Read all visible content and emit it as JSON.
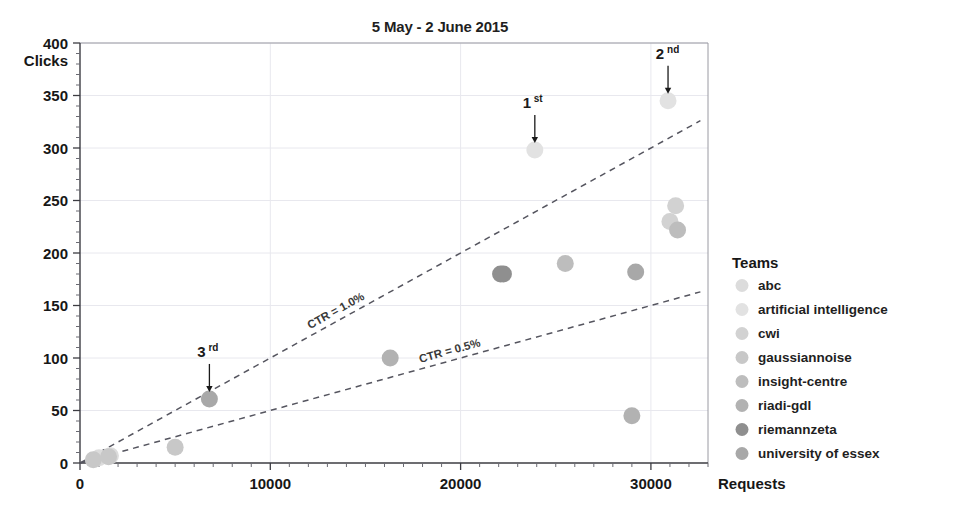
{
  "chart_data": {
    "type": "scatter",
    "title": "5 May - 2 June 2015",
    "xlabel": "Requests",
    "ylabel": "Clicks",
    "xlim": [
      0,
      33000
    ],
    "ylim": [
      0,
      400
    ],
    "xticks": [
      0,
      10000,
      20000,
      30000
    ],
    "xtick_labels": [
      "0",
      "10000",
      "20000",
      "30000"
    ],
    "yticks": [
      0,
      50,
      100,
      150,
      200,
      250,
      300,
      350,
      400
    ],
    "ytick_labels": [
      "0",
      "50",
      "100",
      "150",
      "200",
      "250",
      "300",
      "350",
      "400"
    ],
    "grid": true,
    "grid_color": "#e8e8ee",
    "minor_ticks": true,
    "legend_position": "right",
    "legend_title": "Teams",
    "series": [
      {
        "name": "abc",
        "color": "#dcdcdc",
        "points": [
          [
            1000,
            5
          ],
          [
            1600,
            7
          ]
        ]
      },
      {
        "name": "artificial intelligence",
        "color": "#e2e2e2",
        "points": [
          [
            23900,
            298
          ],
          [
            30900,
            345
          ]
        ]
      },
      {
        "name": "cwi",
        "color": "#d2d2d2",
        "points": [
          [
            31300,
            245
          ],
          [
            31000,
            230
          ]
        ]
      },
      {
        "name": "gaussiannoise",
        "color": "#c8c8c8",
        "points": [
          [
            700,
            3
          ],
          [
            1500,
            6
          ],
          [
            5000,
            15
          ]
        ]
      },
      {
        "name": "insight-centre",
        "color": "#bdbdbd",
        "points": [
          [
            25500,
            190
          ],
          [
            31400,
            222
          ]
        ]
      },
      {
        "name": "riadi-gdl",
        "color": "#b2b2b2",
        "points": [
          [
            16300,
            100
          ],
          [
            29000,
            45
          ]
        ]
      },
      {
        "name": "riemannzeta",
        "color": "#8f8f8f",
        "points": [
          [
            22100,
            180
          ],
          [
            22250,
            180
          ]
        ]
      },
      {
        "name": "university of essex",
        "color": "#a8a8a8",
        "points": [
          [
            6800,
            61
          ],
          [
            29200,
            182
          ]
        ]
      }
    ],
    "reference_lines": [
      {
        "label": "CTR = 1.0%",
        "slope": 0.01,
        "from": [
          0,
          0
        ],
        "to": [
          32600,
          326
        ],
        "style": "dashed",
        "color": "#55555f"
      },
      {
        "label": "CTR = 0.5%",
        "slope": 0.005,
        "from": [
          0,
          0
        ],
        "to": [
          32600,
          163
        ],
        "style": "dashed",
        "color": "#55555f"
      }
    ],
    "annotations": [
      {
        "text": "1",
        "sup": "st",
        "x": 23900,
        "y": 298,
        "label_dx": -8,
        "label_dy": -42
      },
      {
        "text": "2",
        "sup": "nd",
        "x": 30900,
        "y": 345,
        "label_dx": -8,
        "label_dy": -42
      },
      {
        "text": "3",
        "sup": "rd",
        "x": 6800,
        "y": 61,
        "label_dx": -8,
        "label_dy": -42
      }
    ]
  },
  "legend": {
    "title": "Teams",
    "items": [
      {
        "label": "abc",
        "color": "#dcdcdc"
      },
      {
        "label": "artificial intelligence",
        "color": "#e2e2e2"
      },
      {
        "label": "cwi",
        "color": "#d2d2d2"
      },
      {
        "label": "gaussiannoise",
        "color": "#c8c8c8"
      },
      {
        "label": "insight-centre",
        "color": "#bdbdbd"
      },
      {
        "label": "riadi-gdl",
        "color": "#b2b2b2"
      },
      {
        "label": "riemannzeta",
        "color": "#8f8f8f"
      },
      {
        "label": "university of essex",
        "color": "#a8a8a8"
      }
    ]
  },
  "axes": {
    "x_axis_label": "Requests",
    "y_axis_label": "Clicks"
  },
  "header": {
    "title": "5 May - 2 June 2015"
  }
}
